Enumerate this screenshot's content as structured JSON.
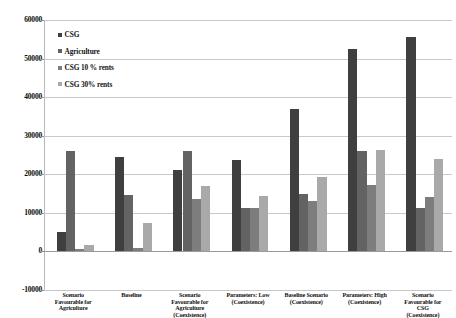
{
  "chart_data": {
    "type": "bar",
    "title": "",
    "xlabel": "",
    "ylabel": "",
    "ylim": [
      -10000,
      60000
    ],
    "ytick_values": [
      60000,
      50000,
      40000,
      30000,
      20000,
      10000,
      0,
      -10000
    ],
    "ytick_labels": [
      "60000",
      "50000",
      "40000",
      "30000",
      "20000",
      "10000",
      "0",
      "-10000"
    ],
    "grid": true,
    "legend_position": "upper-left-inside",
    "categories": [
      "Scenario Favourable for Agriculture",
      "Baseline",
      "Scenario Favourable for Agriculture (Coexistence)",
      "Parameters: Low (Coexistence)",
      "Baseline Scenario (Coexistence)",
      "Parameters: High (Coexistence)",
      "Scenario Favourable for CSG (Coexistence)"
    ],
    "category_lines": [
      [
        "Scenario",
        "Favourable for",
        "Agriculture"
      ],
      [
        "Baseline"
      ],
      [
        "Scenario",
        "Favourable for",
        "Agriculture",
        "(Coexistence)"
      ],
      [
        "Parameters: Low",
        "(Coexistence)"
      ],
      [
        "Baseline Scenario",
        "(Coexistence)"
      ],
      [
        "Parameters: High",
        "(Coexistence)"
      ],
      [
        "Scenario",
        "Favourable for",
        "CSG",
        "(Coexistence)"
      ]
    ],
    "series": [
      {
        "name": "CSG",
        "color": "#3f3f3f",
        "values": [
          5000,
          24500,
          21000,
          23700,
          37000,
          52500,
          55500
        ]
      },
      {
        "name": "Agriculture",
        "color": "#636363",
        "values": [
          26000,
          14700,
          26000,
          11300,
          14800,
          26000,
          11200
        ]
      },
      {
        "name": "CSG 10 % rents",
        "color": "#7d7d7d",
        "values": [
          700,
          900,
          13700,
          11300,
          13000,
          17300,
          14100
        ]
      },
      {
        "name": "CSG 30% rents",
        "color": "#a9a9a9",
        "values": [
          1600,
          7300,
          17000,
          14500,
          19300,
          26300,
          23900
        ]
      }
    ]
  },
  "legend": {
    "items": [
      {
        "label": "CSG",
        "color": "#3f3f3f"
      },
      {
        "label": "Agriculture",
        "color": "#636363"
      },
      {
        "label": "CSG 10 % rents",
        "color": "#7d7d7d"
      },
      {
        "label": "CSG 30% rents",
        "color": "#a9a9a9"
      }
    ]
  }
}
